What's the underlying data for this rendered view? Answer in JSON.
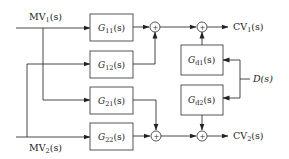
{
  "diagram": {
    "type": "block-diagram",
    "inputs": [
      {
        "id": "mv1",
        "label": "MV",
        "sub": "1",
        "arg": "(s)"
      },
      {
        "id": "mv2",
        "label": "MV",
        "sub": "2",
        "arg": "(s)"
      }
    ],
    "disturbance": {
      "id": "d",
      "label": "D(s)"
    },
    "outputs": [
      {
        "id": "cv1",
        "label": "CV",
        "sub": "1",
        "arg": "(s)"
      },
      {
        "id": "cv2",
        "label": "CV",
        "sub": "2",
        "arg": "(s)"
      }
    ],
    "blocks": [
      {
        "id": "g11",
        "label": "G",
        "sub": "11",
        "arg": "(s)"
      },
      {
        "id": "g12",
        "label": "G",
        "sub": "12",
        "arg": "(s)"
      },
      {
        "id": "g21",
        "label": "G",
        "sub": "21",
        "arg": "(s)"
      },
      {
        "id": "g22",
        "label": "G",
        "sub": "22",
        "arg": "(s)"
      },
      {
        "id": "gd1",
        "label": "G",
        "sub": "d1",
        "arg": "(s)"
      },
      {
        "id": "gd2",
        "label": "G",
        "sub": "d2",
        "arg": "(s)"
      }
    ],
    "summing_junctions": [
      {
        "id": "s1",
        "symbol": "+"
      },
      {
        "id": "s2",
        "symbol": "+"
      },
      {
        "id": "s3",
        "symbol": "+"
      },
      {
        "id": "s4",
        "symbol": "+"
      }
    ],
    "connections": [
      "MV1 -> G11",
      "MV1 -> G21",
      "MV2 -> G12",
      "MV2 -> G22",
      "G11 -> S1",
      "G12 -> S1",
      "S1 -> S2",
      "Gd1 -> S2",
      "S2 -> CV1",
      "G22 -> S3",
      "G21 -> S3",
      "S3 -> S4",
      "Gd2 -> S4",
      "S4 -> CV2",
      "D -> Gd1",
      "D -> Gd2"
    ]
  }
}
